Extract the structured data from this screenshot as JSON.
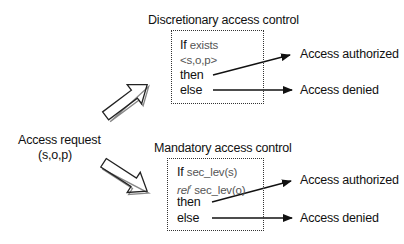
{
  "request": {
    "line1": "Access request",
    "line2": "(s,o,p)"
  },
  "dac": {
    "title": "Discretionary access control",
    "cond_kw": "If",
    "cond_expr": "exists",
    "cond_expr2": "<s,o,p>",
    "then": "then",
    "else": "else",
    "out_then": "Access authorized",
    "out_else": "Access denied"
  },
  "mac": {
    "title": "Mandatory access control",
    "cond_kw": "If",
    "cond_expr": "sec_lev(s)",
    "rel": "rel",
    "rel_sup": "r",
    "cond_expr2": " sec_lev(o)",
    "then": "then",
    "else": "else",
    "out_then": "Access authorized",
    "out_else": "Access denied"
  }
}
